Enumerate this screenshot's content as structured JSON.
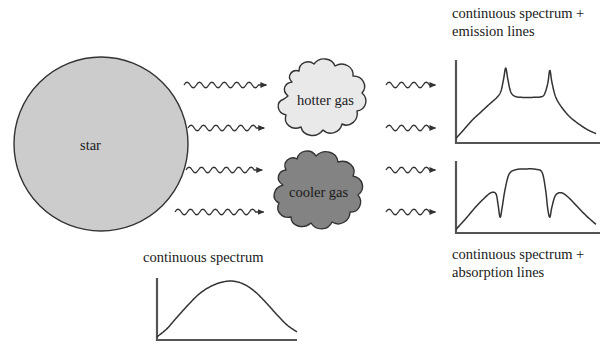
{
  "figure": {
    "title_visible": false,
    "background_color": "#ffffff",
    "line_color": "#333333"
  },
  "objects": {
    "star": {
      "label": "star",
      "fill": "#cccccc",
      "stroke": "#333333",
      "cx": 101,
      "cy": 144,
      "r": 87
    },
    "hotter_gas": {
      "label": "hotter gas",
      "fill": "#e9e9e9",
      "stroke": "#333333"
    },
    "cooler_gas": {
      "label": "cooler gas",
      "fill": "#838383",
      "stroke": "#333333"
    }
  },
  "captions": {
    "emission": "continuous spectrum\n+ emission lines",
    "absorption": "continuous spectrum\n+ absorption lines",
    "continuous": "continuous spectrum"
  },
  "rays": {
    "left_group_label": "wavy-light-rays-from-star",
    "right_group_label": "wavy-light-rays-to-spectra",
    "count_left": 4,
    "count_right": 4,
    "y_positions": [
      85,
      128,
      170,
      212
    ]
  },
  "chart_data": [
    {
      "id": "continuous_spectrum",
      "type": "line",
      "title": "continuous spectrum",
      "xlabel": "",
      "ylabel": "",
      "grid": false,
      "legend": false,
      "axis_origin": [
        157,
        340
      ],
      "axis_width": 140,
      "axis_height": 62,
      "xlim": [
        0,
        1
      ],
      "ylim": [
        0,
        1
      ],
      "x": [
        0.0,
        0.07,
        0.14,
        0.22,
        0.3,
        0.38,
        0.46,
        0.54,
        0.62,
        0.7,
        0.78,
        0.86,
        0.93,
        1.0
      ],
      "values": [
        0.05,
        0.18,
        0.36,
        0.56,
        0.74,
        0.86,
        0.93,
        0.95,
        0.9,
        0.78,
        0.6,
        0.4,
        0.24,
        0.13
      ],
      "description": "smooth blackbody-like continuum peaking near center-left"
    },
    {
      "id": "emission_spectrum",
      "type": "line",
      "title": "continuous spectrum + emission lines",
      "xlabel": "",
      "ylabel": "",
      "grid": false,
      "legend": false,
      "axis_origin": [
        456,
        143
      ],
      "axis_width": 140,
      "axis_height": 78,
      "xlim": [
        0,
        1
      ],
      "ylim": [
        0,
        1
      ],
      "x": [
        0.0,
        0.06,
        0.12,
        0.18,
        0.24,
        0.29,
        0.32,
        0.34,
        0.355,
        0.37,
        0.39,
        0.42,
        0.47,
        0.55,
        0.6,
        0.63,
        0.655,
        0.67,
        0.685,
        0.71,
        0.75,
        0.81,
        0.88,
        0.94,
        1.0
      ],
      "values": [
        0.06,
        0.18,
        0.3,
        0.4,
        0.5,
        0.58,
        0.66,
        0.82,
        0.96,
        0.82,
        0.66,
        0.6,
        0.585,
        0.585,
        0.59,
        0.62,
        0.76,
        0.93,
        0.78,
        0.6,
        0.47,
        0.34,
        0.24,
        0.17,
        0.12
      ],
      "emission_lines": [
        0.355,
        0.67
      ],
      "description": "continuum with two sharp narrow emission peaks rising above a flat plateau"
    },
    {
      "id": "absorption_spectrum",
      "type": "line",
      "title": "continuous spectrum + absorption lines",
      "xlabel": "",
      "ylabel": "",
      "grid": false,
      "legend": false,
      "axis_origin": [
        456,
        233
      ],
      "axis_width": 140,
      "axis_height": 72,
      "xlim": [
        0,
        1
      ],
      "ylim": [
        0,
        1
      ],
      "x": [
        0.0,
        0.07,
        0.14,
        0.2,
        0.25,
        0.285,
        0.3,
        0.315,
        0.33,
        0.35,
        0.38,
        0.43,
        0.5,
        0.57,
        0.615,
        0.64,
        0.655,
        0.67,
        0.685,
        0.71,
        0.75,
        0.8,
        0.86,
        0.93,
        1.0
      ],
      "values": [
        0.05,
        0.2,
        0.36,
        0.48,
        0.56,
        0.545,
        0.4,
        0.22,
        0.36,
        0.6,
        0.82,
        0.88,
        0.89,
        0.885,
        0.84,
        0.6,
        0.34,
        0.22,
        0.36,
        0.52,
        0.56,
        0.5,
        0.38,
        0.24,
        0.12
      ],
      "absorption_lines": [
        0.315,
        0.67
      ],
      "description": "continuum with a broad flat top interrupted by two deep narrow absorption dips"
    }
  ]
}
